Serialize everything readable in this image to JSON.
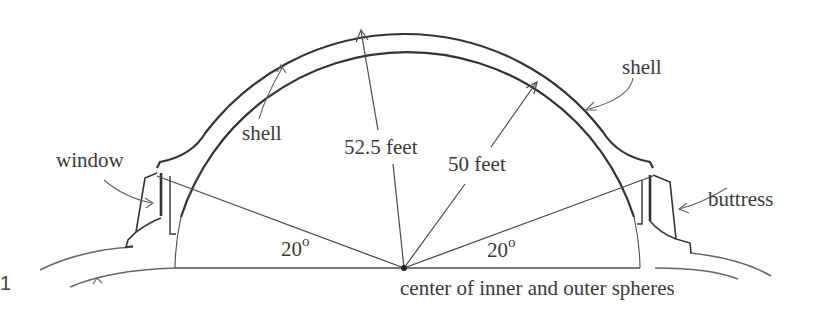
{
  "figure": {
    "type": "dome cross-section diagram",
    "figure_number_fragment": "1",
    "colors": {
      "ink": "#333333",
      "background": "#ffffff"
    }
  },
  "labels": {
    "window": "window",
    "shell_left": "shell",
    "shell_right": "shell",
    "outer_radius": "52.5 feet",
    "inner_radius": "50 feet",
    "buttress": "buttress",
    "angle_left": "20",
    "angle_right": "20",
    "degree_symbol": "o",
    "center": "center of inner and outer spheres"
  },
  "geometry": {
    "inner_radius_ft": 50,
    "outer_radius_ft": 52.5,
    "base_angle_deg": 20
  }
}
